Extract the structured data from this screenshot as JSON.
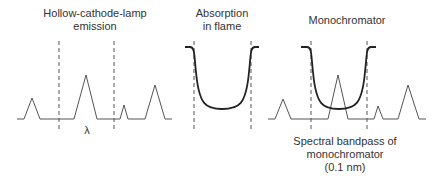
{
  "panels": [
    {
      "id": "lamp",
      "title_lines": [
        "Hollow-cathode-lamp",
        "emission"
      ],
      "title_x": 95,
      "title_top": 7
    },
    {
      "id": "flame",
      "title_lines": [
        "Absorption",
        "in flame"
      ],
      "title_x": 222,
      "title_top": 7
    },
    {
      "id": "mono",
      "title_lines": [
        "Monochromator"
      ],
      "title_x": 347,
      "title_top": 14
    }
  ],
  "axis_symbol": "λ",
  "axis_symbol_pos": {
    "x": 87,
    "y": 124
  },
  "bandpass_label": {
    "lines": [
      "Spectral bandpass of",
      "monochromator",
      "(0.1 nm)"
    ],
    "x": 345,
    "top": 135
  },
  "colors": {
    "spectrum": "#555555",
    "profile": "#222222",
    "text": "#333333"
  },
  "shapes": {
    "lamp_spectrum": [
      [
        17,
        119
      ],
      [
        24,
        119
      ],
      [
        32,
        98
      ],
      [
        40,
        119
      ],
      [
        74,
        119
      ],
      [
        86,
        75
      ],
      [
        97,
        119
      ],
      [
        120,
        119
      ],
      [
        124,
        105
      ],
      [
        128,
        119
      ],
      [
        145,
        119
      ],
      [
        155,
        85
      ],
      [
        165,
        119
      ],
      [
        172,
        119
      ]
    ],
    "mono_spectrum": [
      [
        268,
        119
      ],
      [
        275,
        119
      ],
      [
        283,
        99
      ],
      [
        291,
        119
      ],
      [
        328,
        119
      ],
      [
        338,
        75
      ],
      [
        348,
        119
      ],
      [
        374,
        119
      ],
      [
        378,
        106
      ],
      [
        383,
        119
      ],
      [
        398,
        119
      ],
      [
        408,
        85
      ],
      [
        419,
        119
      ],
      [
        426,
        119
      ]
    ],
    "flame_profile": {
      "x_left": 185,
      "x_right": 259,
      "top": 47,
      "bottom": 109,
      "wall_left": 194,
      "wall_right": 251
    },
    "mono_profile": {
      "x_left": 301,
      "x_right": 376,
      "top": 47,
      "bottom": 109,
      "wall_left": 311,
      "wall_right": 367
    },
    "dashed_lines": [
      {
        "x": 59,
        "y1": 41,
        "y2": 131
      },
      {
        "x": 114,
        "y1": 41,
        "y2": 131
      },
      {
        "x": 194,
        "y1": 41,
        "y2": 131
      },
      {
        "x": 251,
        "y1": 41,
        "y2": 131
      },
      {
        "x": 311,
        "y1": 41,
        "y2": 131
      },
      {
        "x": 367,
        "y1": 41,
        "y2": 131
      }
    ]
  }
}
